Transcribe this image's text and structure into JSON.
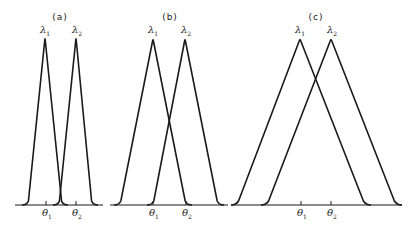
{
  "figure": {
    "panels": [
      {
        "id": "a",
        "label": "(a)",
        "label_pos": [
          60,
          17
        ],
        "axis": {
          "x0": 15,
          "x1": 103,
          "y": 205
        },
        "curves": [
          {
            "name": "λ1",
            "peak_x": 45,
            "peak_y": 38,
            "foot_left": 27,
            "foot_right": 63
          },
          {
            "name": "λ2",
            "peak_x": 76,
            "peak_y": 38,
            "foot_left": 58,
            "foot_right": 93
          }
        ],
        "peak_labels": [
          {
            "sym": "λ",
            "sub": "1",
            "x": 45,
            "y": 31
          },
          {
            "sym": "λ",
            "sub": "2",
            "x": 77,
            "y": 31
          }
        ],
        "ticks": [
          {
            "sym": "θ",
            "sub": "1",
            "x": 46
          },
          {
            "sym": "θ",
            "sub": "2",
            "x": 76
          }
        ]
      },
      {
        "id": "b",
        "label": "(b)",
        "label_pos": [
          170,
          17
        ],
        "axis": {
          "x0": 110,
          "x1": 228,
          "y": 205
        },
        "curves": [
          {
            "name": "λ1",
            "peak_x": 153,
            "peak_y": 39,
            "foot_left": 119,
            "foot_right": 187
          },
          {
            "name": "λ2",
            "peak_x": 185,
            "peak_y": 39,
            "foot_left": 152,
            "foot_right": 219
          }
        ],
        "peak_labels": [
          {
            "sym": "λ",
            "sub": "1",
            "x": 153,
            "y": 31
          },
          {
            "sym": "λ",
            "sub": "2",
            "x": 186,
            "y": 31
          }
        ],
        "ticks": [
          {
            "sym": "θ",
            "sub": "1",
            "x": 153
          },
          {
            "sym": "θ",
            "sub": "2",
            "x": 186
          }
        ]
      },
      {
        "id": "c",
        "label": "(c)",
        "label_pos": [
          316,
          17
        ],
        "axis": {
          "x0": 231,
          "x1": 402,
          "y": 205
        },
        "curves": [
          {
            "name": "λ1",
            "peak_x": 300,
            "peak_y": 39,
            "foot_left": 236,
            "foot_right": 366
          },
          {
            "name": "λ2",
            "peak_x": 331,
            "peak_y": 39,
            "foot_left": 266,
            "foot_right": 397
          }
        ],
        "peak_labels": [
          {
            "sym": "λ",
            "sub": "1",
            "x": 300,
            "y": 31
          },
          {
            "sym": "λ",
            "sub": "2",
            "x": 332,
            "y": 31
          }
        ],
        "ticks": [
          {
            "sym": "θ",
            "sub": "1",
            "x": 301
          },
          {
            "sym": "θ",
            "sub": "2",
            "x": 331
          }
        ]
      }
    ],
    "style": {
      "stroke": "#1a1a1a",
      "background": "#ffffff"
    }
  }
}
